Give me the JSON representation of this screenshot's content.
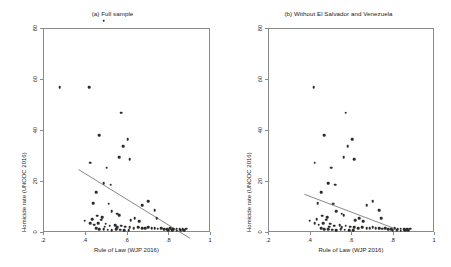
{
  "figure": {
    "background": "#ffffff",
    "point_color": "#2b2b2b",
    "line_color": "#555555",
    "axis_color": "#8a8a8a"
  },
  "chart_data": [
    {
      "type": "scatter",
      "panel_id": "a",
      "title": "(a) Full sample",
      "xlabel": "Rule of Law (WJP 2016)",
      "ylabel": "Homicide rate (UNODC 2016)",
      "xlim": [
        0.2,
        1.0
      ],
      "ylim": [
        0,
        80
      ],
      "xticks": [
        0.2,
        0.4,
        0.6,
        0.8,
        1.0
      ],
      "xticklabels": [
        ".2",
        ".4",
        ".6",
        ".8",
        "1"
      ],
      "yticks": [
        0,
        20,
        40,
        60,
        80
      ],
      "yticklabels": [
        "0",
        "20",
        "40",
        "60",
        "80"
      ],
      "grid": false,
      "legend": "none",
      "fit_line": {
        "x0": 0.37,
        "y0": 24.5,
        "x1": 0.905,
        "y1": -2.5
      },
      "points": [
        [
          0.49,
          82.8
        ],
        [
          0.28,
          56.8
        ],
        [
          0.42,
          56.7
        ],
        [
          0.575,
          46.8
        ],
        [
          0.47,
          37.9
        ],
        [
          0.605,
          36.4
        ],
        [
          0.585,
          33.7
        ],
        [
          0.565,
          29.4
        ],
        [
          0.615,
          28.5
        ],
        [
          0.425,
          27.1
        ],
        [
          0.505,
          25.2
        ],
        [
          0.49,
          19.1
        ],
        [
          0.525,
          18.5
        ],
        [
          0.455,
          15.7
        ],
        [
          0.44,
          11.2
        ],
        [
          0.515,
          11.1
        ],
        [
          0.675,
          10.6
        ],
        [
          0.705,
          12.1
        ],
        [
          0.735,
          8.6
        ],
        [
          0.745,
          5.5
        ],
        [
          0.53,
          8.1
        ],
        [
          0.555,
          7.2
        ],
        [
          0.565,
          6.6
        ],
        [
          0.46,
          6.4
        ],
        [
          0.435,
          5.1
        ],
        [
          0.4,
          4.4
        ],
        [
          0.48,
          4.9
        ],
        [
          0.485,
          5.9
        ],
        [
          0.465,
          3.5
        ],
        [
          0.445,
          2.9
        ],
        [
          0.425,
          3.4
        ],
        [
          0.5,
          3.3
        ],
        [
          0.495,
          2.1
        ],
        [
          0.52,
          2.4
        ],
        [
          0.545,
          2.6
        ],
        [
          0.555,
          1.9
        ],
        [
          0.575,
          2.4
        ],
        [
          0.595,
          2.1
        ],
        [
          0.615,
          1.8
        ],
        [
          0.635,
          1.6
        ],
        [
          0.655,
          1.9
        ],
        [
          0.675,
          1.5
        ],
        [
          0.69,
          1.4
        ],
        [
          0.705,
          1.9
        ],
        [
          0.72,
          1.6
        ],
        [
          0.735,
          1.5
        ],
        [
          0.75,
          1.3
        ],
        [
          0.765,
          1.5
        ],
        [
          0.78,
          1.2
        ],
        [
          0.795,
          1.1
        ],
        [
          0.81,
          1.4
        ],
        [
          0.825,
          1.0
        ],
        [
          0.84,
          1.3
        ],
        [
          0.855,
          1.2
        ],
        [
          0.87,
          1.1
        ],
        [
          0.885,
          1.3
        ],
        [
          0.8,
          0.6
        ],
        [
          0.82,
          0.7
        ],
        [
          0.84,
          0.5
        ],
        [
          0.86,
          0.6
        ],
        [
          0.875,
          0.8
        ],
        [
          0.66,
          4.2
        ],
        [
          0.64,
          5.4
        ],
        [
          0.62,
          4.6
        ],
        [
          0.51,
          0.9
        ],
        [
          0.53,
          0.8
        ],
        [
          0.55,
          1.0
        ],
        [
          0.57,
          0.9
        ],
        [
          0.59,
          0.7
        ],
        [
          0.61,
          0.8
        ],
        [
          0.47,
          1.2
        ],
        [
          0.49,
          1.0
        ],
        [
          0.455,
          1.5
        ]
      ]
    },
    {
      "type": "scatter",
      "panel_id": "b",
      "title": "(b) Without El Salvador and Venezuela",
      "xlabel": "Rule of Law (WJP 2016)",
      "ylabel": "Homicide rate (UNODC 2016)",
      "xlim": [
        0.2,
        1.0
      ],
      "ylim": [
        0,
        80
      ],
      "xticks": [
        0.2,
        0.4,
        0.6,
        0.8,
        1.0
      ],
      "xticklabels": [
        ".2",
        ".4",
        ".6",
        ".8",
        "1"
      ],
      "yticks": [
        0,
        20,
        40,
        60,
        80
      ],
      "yticklabels": [
        "0",
        "20",
        "40",
        "60",
        "80"
      ],
      "grid": false,
      "legend": "none",
      "fit_line": {
        "x0": 0.375,
        "y0": 14.8,
        "x1": 0.815,
        "y1": 1.2
      },
      "points": [
        [
          0.42,
          56.7
        ],
        [
          0.575,
          46.8
        ],
        [
          0.47,
          37.9
        ],
        [
          0.605,
          36.4
        ],
        [
          0.585,
          33.7
        ],
        [
          0.565,
          29.4
        ],
        [
          0.615,
          28.5
        ],
        [
          0.425,
          27.1
        ],
        [
          0.505,
          25.2
        ],
        [
          0.49,
          19.1
        ],
        [
          0.525,
          18.5
        ],
        [
          0.455,
          15.7
        ],
        [
          0.44,
          11.2
        ],
        [
          0.515,
          11.1
        ],
        [
          0.675,
          10.6
        ],
        [
          0.705,
          12.1
        ],
        [
          0.735,
          8.6
        ],
        [
          0.745,
          5.5
        ],
        [
          0.53,
          8.1
        ],
        [
          0.555,
          7.2
        ],
        [
          0.565,
          6.6
        ],
        [
          0.46,
          6.4
        ],
        [
          0.435,
          5.1
        ],
        [
          0.4,
          4.4
        ],
        [
          0.48,
          4.9
        ],
        [
          0.485,
          5.9
        ],
        [
          0.465,
          3.5
        ],
        [
          0.445,
          2.9
        ],
        [
          0.425,
          3.4
        ],
        [
          0.5,
          3.3
        ],
        [
          0.495,
          2.1
        ],
        [
          0.52,
          2.4
        ],
        [
          0.545,
          2.6
        ],
        [
          0.555,
          1.9
        ],
        [
          0.575,
          2.4
        ],
        [
          0.595,
          2.1
        ],
        [
          0.615,
          1.8
        ],
        [
          0.635,
          1.6
        ],
        [
          0.655,
          1.9
        ],
        [
          0.675,
          1.5
        ],
        [
          0.69,
          1.4
        ],
        [
          0.705,
          1.9
        ],
        [
          0.72,
          1.6
        ],
        [
          0.735,
          1.5
        ],
        [
          0.75,
          1.3
        ],
        [
          0.765,
          1.5
        ],
        [
          0.78,
          1.2
        ],
        [
          0.795,
          1.1
        ],
        [
          0.81,
          1.4
        ],
        [
          0.825,
          1.0
        ],
        [
          0.84,
          1.3
        ],
        [
          0.855,
          1.2
        ],
        [
          0.87,
          1.1
        ],
        [
          0.885,
          1.3
        ],
        [
          0.8,
          0.6
        ],
        [
          0.82,
          0.7
        ],
        [
          0.84,
          0.5
        ],
        [
          0.86,
          0.6
        ],
        [
          0.875,
          0.8
        ],
        [
          0.66,
          4.2
        ],
        [
          0.64,
          5.4
        ],
        [
          0.62,
          4.6
        ],
        [
          0.51,
          0.9
        ],
        [
          0.53,
          0.8
        ],
        [
          0.55,
          1.0
        ],
        [
          0.57,
          0.9
        ],
        [
          0.59,
          0.7
        ],
        [
          0.61,
          0.8
        ],
        [
          0.47,
          1.2
        ],
        [
          0.49,
          1.0
        ],
        [
          0.455,
          1.5
        ]
      ]
    }
  ]
}
